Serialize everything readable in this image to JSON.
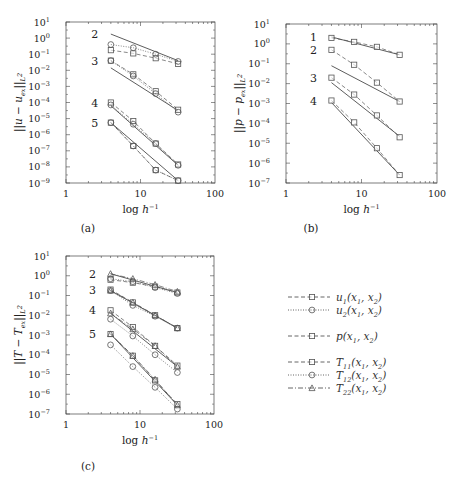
{
  "chart_data": [
    {
      "id": "a",
      "type": "line",
      "caption": "(a)",
      "xlabel": "log h^-1",
      "ylabel": "||u - u_ex||_L2",
      "xscale": "log",
      "yscale": "log",
      "xlim": [
        1,
        100
      ],
      "ylim_exp": [
        -9,
        1
      ],
      "xticks": [
        "1",
        "10",
        "100"
      ],
      "yticks_exp": [
        1,
        0,
        -1,
        -2,
        -3,
        -4,
        -5,
        -6,
        -7,
        -8,
        -9
      ],
      "x": [
        4,
        8,
        16,
        32
      ],
      "groups": [
        {
          "order": "2",
          "ref_line_exp": [
            0.25,
            -1.4
          ],
          "series": [
            {
              "name": "u1",
              "marker": "square",
              "line": "dashed",
              "log10": [
                -0.75,
                -0.95,
                -1.25,
                -1.6
              ]
            },
            {
              "name": "u2",
              "marker": "circle",
              "line": "dotted",
              "log10": [
                -0.4,
                -0.6,
                -1.0,
                -1.45
              ]
            }
          ]
        },
        {
          "order": "3",
          "ref_line_exp": [
            -1.85,
            -4.5
          ],
          "series": [
            {
              "name": "u1",
              "marker": "square",
              "line": "dashed",
              "log10": [
                -1.4,
                -2.25,
                -3.3,
                -4.45
              ]
            },
            {
              "name": "u2",
              "marker": "circle",
              "line": "dotted",
              "log10": [
                -1.4,
                -2.35,
                -3.45,
                -4.6
              ]
            }
          ]
        },
        {
          "order": "4",
          "ref_line_exp": [
            -4.2,
            -7.9
          ],
          "series": [
            {
              "name": "u1",
              "marker": "square",
              "line": "dashed",
              "log10": [
                -4.0,
                -5.15,
                -6.55,
                -7.85
              ]
            },
            {
              "name": "u2",
              "marker": "circle",
              "line": "dotted",
              "log10": [
                -4.15,
                -5.35,
                -6.55,
                -7.9
              ]
            }
          ]
        },
        {
          "order": "5",
          "ref_line_exp": [
            -5.25,
            -8.85
          ],
          "series": [
            {
              "name": "u1",
              "marker": "square",
              "line": "dashed",
              "log10": [
                -5.25,
                -6.7,
                -8.2,
                -8.85
              ]
            },
            {
              "name": "u2",
              "marker": "circle",
              "line": "dotted",
              "log10": [
                -5.25,
                -6.7,
                -8.2,
                -8.85
              ]
            }
          ]
        }
      ]
    },
    {
      "id": "b",
      "type": "line",
      "caption": "(b)",
      "xlabel": "log h^-1",
      "ylabel": "||p - p_ex||_L2",
      "xscale": "log",
      "yscale": "log",
      "xlim": [
        1,
        100
      ],
      "ylim_exp": [
        -7,
        1
      ],
      "xticks": [
        "1",
        "10",
        "100"
      ],
      "yticks_exp": [
        1,
        0,
        -1,
        -2,
        -3,
        -4,
        -5,
        -6,
        -7
      ],
      "x": [
        4,
        8,
        16,
        32
      ],
      "groups": [
        {
          "order": "1",
          "ref_line_exp": [
            0.35,
            -0.55
          ],
          "series": [
            {
              "name": "p",
              "marker": "square",
              "line": "dashed",
              "log10": [
                0.3,
                0.1,
                -0.15,
                -0.55
              ]
            }
          ]
        },
        {
          "order": "2",
          "ref_line_exp": [
            -1.1,
            -2.9
          ],
          "series": [
            {
              "name": "p",
              "marker": "square",
              "line": "dashed",
              "log10": [
                -0.3,
                -1.05,
                -1.95,
                -2.9
              ]
            }
          ]
        },
        {
          "order": "3",
          "ref_line_exp": [
            -1.95,
            -4.65
          ],
          "series": [
            {
              "name": "p",
              "marker": "square",
              "line": "dashed",
              "log10": [
                -1.7,
                -2.55,
                -3.6,
                -4.7
              ]
            }
          ]
        },
        {
          "order": "4",
          "ref_line_exp": [
            -2.95,
            -6.6
          ],
          "series": [
            {
              "name": "p",
              "marker": "square",
              "line": "dashed",
              "log10": [
                -2.85,
                -3.95,
                -5.25,
                -6.6
              ]
            }
          ]
        }
      ]
    },
    {
      "id": "c",
      "type": "line",
      "caption": "(c)",
      "xlabel": "log h^-1",
      "ylabel": "||T - T_ex||_L2",
      "xscale": "log",
      "yscale": "log",
      "xlim": [
        1,
        100
      ],
      "ylim_exp": [
        -7,
        1
      ],
      "xticks": [
        "1",
        "10",
        "100"
      ],
      "yticks_exp": [
        1,
        0,
        -1,
        -2,
        -3,
        -4,
        -5,
        -6,
        -7
      ],
      "x": [
        4,
        8,
        16,
        32
      ],
      "groups": [
        {
          "order": "2",
          "ref_line_exp": [
            0.1,
            -0.85
          ],
          "series": [
            {
              "name": "T11",
              "marker": "square",
              "line": "dashed",
              "log10": [
                -0.2,
                -0.35,
                -0.55,
                -0.85
              ]
            },
            {
              "name": "T12",
              "marker": "circle",
              "line": "dotted",
              "log10": [
                -0.15,
                -0.3,
                -0.6,
                -0.9
              ]
            },
            {
              "name": "T22",
              "marker": "triangle",
              "line": "dashdot",
              "log10": [
                0.1,
                -0.15,
                -0.45,
                -0.8
              ]
            }
          ]
        },
        {
          "order": "3",
          "ref_line_exp": [
            -0.75,
            -2.65
          ],
          "series": [
            {
              "name": "T11",
              "marker": "square",
              "line": "dashed",
              "log10": [
                -0.7,
                -1.35,
                -2.0,
                -2.65
              ]
            },
            {
              "name": "T12",
              "marker": "circle",
              "line": "dotted",
              "log10": [
                -0.75,
                -1.5,
                -2.05,
                -2.65
              ]
            },
            {
              "name": "T22",
              "marker": "triangle",
              "line": "dashdot",
              "log10": [
                -0.75,
                -1.35,
                -2.0,
                -2.65
              ]
            }
          ]
        },
        {
          "order": "4",
          "ref_line_exp": [
            -1.9,
            -4.6
          ],
          "series": [
            {
              "name": "T11",
              "marker": "square",
              "line": "dashed",
              "log10": [
                -1.75,
                -2.6,
                -3.55,
                -4.55
              ]
            },
            {
              "name": "T12",
              "marker": "circle",
              "line": "dotted",
              "log10": [
                -2.2,
                -3.05,
                -4.0,
                -4.9
              ]
            },
            {
              "name": "T22",
              "marker": "triangle",
              "line": "dashdot",
              "log10": [
                -1.9,
                -2.7,
                -3.55,
                -4.6
              ]
            }
          ]
        },
        {
          "order": "5",
          "ref_line_exp": [
            -2.95,
            -6.55
          ],
          "series": [
            {
              "name": "T11",
              "marker": "square",
              "line": "dashed",
              "log10": [
                -2.95,
                -4.05,
                -5.3,
                -6.5
              ]
            },
            {
              "name": "T12",
              "marker": "circle",
              "line": "dotted",
              "log10": [
                -3.5,
                -4.6,
                -5.65,
                -6.75
              ]
            },
            {
              "name": "T22",
              "marker": "triangle",
              "line": "dashdot",
              "log10": [
                -2.95,
                -4.05,
                -5.25,
                -6.55
              ]
            }
          ]
        }
      ]
    }
  ],
  "legend": {
    "items": [
      {
        "label_base": "u",
        "label_sub": "1",
        "label_tail": "(x1, x2)",
        "marker": "square",
        "line": "dashed"
      },
      {
        "label_base": "u",
        "label_sub": "2",
        "label_tail": "(x1, x2)",
        "marker": "circle",
        "line": "dotted"
      },
      {
        "label_base": "p",
        "label_sub": "",
        "label_tail": "(x1, x2)",
        "marker": "square",
        "line": "dashed"
      },
      {
        "label_base": "T",
        "label_sub": "11",
        "label_tail": "(x1, x2)",
        "marker": "square",
        "line": "dashed"
      },
      {
        "label_base": "T",
        "label_sub": "12",
        "label_tail": "(x1, x2)",
        "marker": "circle",
        "line": "dotted"
      },
      {
        "label_base": "T",
        "label_sub": "22",
        "label_tail": "(x1, x2)",
        "marker": "triangle",
        "line": "dashdot"
      }
    ]
  },
  "colors": {
    "axis": "#444444",
    "data": "#555555",
    "ref": "#333333",
    "marker": "#555555"
  }
}
